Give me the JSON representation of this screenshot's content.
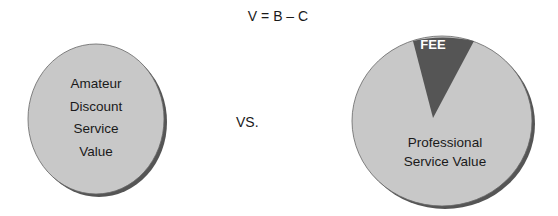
{
  "formula": "V = B – C",
  "left_circle": {
    "lines": [
      "Amateur",
      "Discount",
      "Service",
      "Value"
    ],
    "fill": "#c8c8c8"
  },
  "separator": "VS.",
  "right_circle": {
    "slice_label": "FEE",
    "body_lines": [
      "Professional",
      "Service Value"
    ],
    "fill": "#c8c8c8",
    "slice_fill": "#555555"
  }
}
